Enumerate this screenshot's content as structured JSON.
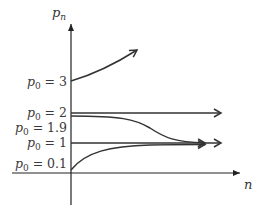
{
  "diagram": {
    "type": "sequence-convergence-plot",
    "y_axis_label": "p",
    "y_axis_label_sub": "n",
    "x_axis_label": "n",
    "initial_values": [
      {
        "label_var": "p",
        "label_sub": "0",
        "label_eq": " = 3",
        "value": 3,
        "behavior": "diverges upward"
      },
      {
        "label_var": "p",
        "label_sub": "0",
        "label_eq": " = 2",
        "value": 2,
        "behavior": "constant"
      },
      {
        "label_var": "p",
        "label_sub": "0",
        "label_eq": " = 1.9",
        "value": 1.9,
        "behavior": "decreases to 1"
      },
      {
        "label_var": "p",
        "label_sub": "0",
        "label_eq": " = 1",
        "value": 1,
        "behavior": "constant"
      },
      {
        "label_var": "p",
        "label_sub": "0",
        "label_eq": " = 0.1",
        "value": 0.1,
        "behavior": "increases to 1"
      }
    ],
    "colors": {
      "curve": "#333333",
      "axis": "#222222",
      "text": "#3a3a3a"
    }
  }
}
